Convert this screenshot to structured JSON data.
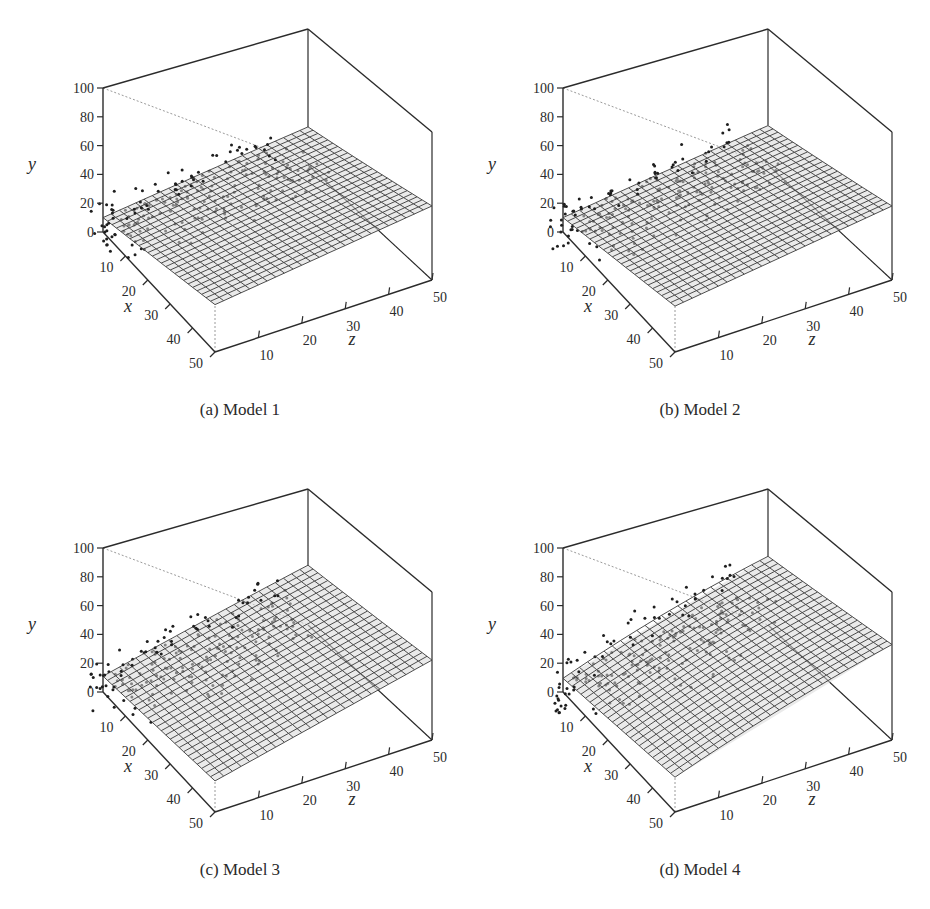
{
  "figure": {
    "panels": [
      {
        "id": "a",
        "caption": "(a) Model 1",
        "plane": {
          "c": 10,
          "bx": 0.44,
          "bz": 0.36,
          "curv": 0.0
        }
      },
      {
        "id": "b",
        "caption": "(b) Model 2",
        "plane": {
          "c": 10,
          "bx": 0.42,
          "bz": 0.38,
          "curv": 0.0
        }
      },
      {
        "id": "c",
        "caption": "(c) Model 3",
        "plane": {
          "c": 11,
          "bx": 0.2,
          "bz": 0.66,
          "curv": 0.0
        }
      },
      {
        "id": "d",
        "caption": "(d) Model 4",
        "plane": {
          "c": 12,
          "bx": 0.28,
          "bz": 0.82,
          "curv": -0.004
        }
      }
    ]
  },
  "chart_data": [
    {
      "type": "surface3d",
      "title": "(a) Model 1",
      "xlabel": "x",
      "ylabel": "y",
      "zlabel": "z",
      "xlim": [
        0,
        50
      ],
      "ylim": [
        0,
        100
      ],
      "zlim": [
        0,
        50
      ],
      "x_ticks": [
        10,
        20,
        30,
        40,
        50
      ],
      "y_ticks": [
        0,
        20,
        40,
        60,
        80,
        100
      ],
      "z_ticks": [
        10,
        20,
        30,
        40,
        50
      ],
      "surface": {
        "form": "plane",
        "y_at_x0_z0": 10,
        "y_at_x50_z0": 32,
        "y_at_x0_z50": 28,
        "y_at_x50_z50": 50,
        "grid": "25x25 mesh"
      },
      "scatter": {
        "description": "observed points clustered at low x (0-15), spread across z 0-45, y roughly 0-30",
        "approx_count": 150
      }
    },
    {
      "type": "surface3d",
      "title": "(b) Model 2",
      "xlabel": "x",
      "ylabel": "y",
      "zlabel": "z",
      "xlim": [
        0,
        50
      ],
      "ylim": [
        0,
        100
      ],
      "zlim": [
        0,
        50
      ],
      "x_ticks": [
        10,
        20,
        30,
        40,
        50
      ],
      "y_ticks": [
        0,
        20,
        40,
        60,
        80,
        100
      ],
      "z_ticks": [
        10,
        20,
        30,
        40,
        50
      ],
      "surface": {
        "form": "plane",
        "y_at_x0_z0": 10,
        "y_at_x50_z0": 31,
        "y_at_x0_z50": 29,
        "y_at_x50_z50": 50,
        "grid": "25x25 mesh"
      },
      "scatter": {
        "description": "observed points clustered at low x (0-15), spread across z 0-45, y roughly 0-30",
        "approx_count": 150
      }
    },
    {
      "type": "surface3d",
      "title": "(c) Model 3",
      "xlabel": "x",
      "ylabel": "y",
      "zlabel": "z",
      "xlim": [
        0,
        50
      ],
      "ylim": [
        0,
        100
      ],
      "zlim": [
        0,
        50
      ],
      "x_ticks": [
        10,
        20,
        30,
        40,
        50
      ],
      "y_ticks": [
        0,
        20,
        40,
        60,
        80,
        100
      ],
      "z_ticks": [
        10,
        20,
        30,
        40,
        50
      ],
      "surface": {
        "form": "plane",
        "y_at_x0_z0": 11,
        "y_at_x50_z0": 21,
        "y_at_x0_z50": 44,
        "y_at_x50_z50": 54,
        "grid": "25x25 mesh"
      },
      "scatter": {
        "description": "observed points clustered at low x (0-15), spread across z 0-45, y roughly 0-30",
        "approx_count": 150
      }
    },
    {
      "type": "surface3d",
      "title": "(d) Model 4",
      "xlabel": "x",
      "ylabel": "y",
      "zlabel": "z",
      "xlim": [
        0,
        50
      ],
      "ylim": [
        0,
        100
      ],
      "zlim": [
        0,
        50
      ],
      "x_ticks": [
        10,
        20,
        30,
        40,
        50
      ],
      "y_ticks": [
        0,
        20,
        40,
        60,
        80,
        100
      ],
      "z_ticks": [
        10,
        20,
        30,
        40,
        50
      ],
      "surface": {
        "form": "slightly curved surface",
        "y_at_x0_z0": 12,
        "y_at_x50_z0": 26,
        "y_at_x0_z50": 53,
        "y_at_x50_z50": 57,
        "grid": "25x25 mesh"
      },
      "scatter": {
        "description": "observed points clustered at low x (0-15), spread across z 0-45, y roughly 0-30",
        "approx_count": 150
      }
    }
  ],
  "axes": {
    "x_label": "x",
    "y_label": "y",
    "z_label": "z",
    "y_ticks": [
      "0",
      "20",
      "40",
      "60",
      "80",
      "100"
    ],
    "x_ticks": [
      "10",
      "20",
      "30",
      "40",
      "50"
    ],
    "z_ticks": [
      "10",
      "20",
      "30",
      "40",
      "50"
    ]
  },
  "colors": {
    "ink": "#2b2b2b",
    "mesh": "#3a3a3a",
    "mesh_fill": "#d9d9d9",
    "dotted": "#9a9a9a",
    "point": "#1e1e1e"
  }
}
